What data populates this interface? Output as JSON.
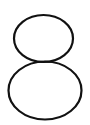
{
  "glyph": {
    "character": "8",
    "style": "outline",
    "stroke_color": "#111111",
    "background_color": "#ffffff",
    "stroke_width": 2.2,
    "top_loop": {
      "cx": 43.5,
      "cy": 38.5,
      "rx": 29.5,
      "ry": 23.5
    },
    "bottom_loop": {
      "cx": 45,
      "cy": 90.5,
      "rx": 36.5,
      "ry": 29
    }
  }
}
